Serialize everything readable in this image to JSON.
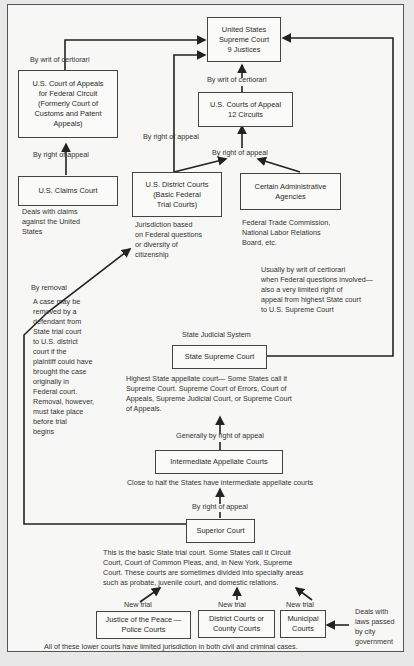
{
  "diagram": {
    "federal": {
      "supreme_court": "United States\nSupreme Court\n9 Justices",
      "federal_circuit": "U.S. Court of Appeals\nfor Federal Circuit\n(Formerly Court of\nCustoms and Patent\nAppeals)",
      "courts_of_appeal": "U.S. Courts of Appeal\n12 Circuits",
      "claims_court": "U.S. Claims Court",
      "claims_court_note": "Deals with claims\nagainst the United\nStates",
      "district_courts": "U.S. District Courts\n(Basic Federal\nTrial Courts)",
      "district_courts_note": "Jurisdiction based\non Federal questions\nor diversity of\ncitizenship",
      "admin_agencies": "Certain Administrative\nAgencies",
      "admin_agencies_note": "Federal Trade Commission,\nNational Labor Relations\nBoard, etc."
    },
    "labels": {
      "cert_federal_circuit": "By writ of certiorari",
      "cert_courts_of_appeal": "By writ of certiorari",
      "appeal_claims": "By right of appeal",
      "appeal_district": "By right of appeal",
      "appeal_to_circuits": "By right of appeal",
      "state_to_us_supreme": "Usually by writ of certiorari\nwhen Federal questions involved—\nalso a very limited right of\nappeal from highest State court\nto U.S. Supreme Court",
      "removal_title": "By removal",
      "removal_note": "A case may be\nremoved by a\ndefendant from\nState trial court\nto U.S. district\ncourt if the\nplaintiff could have\nbrought the case\noriginally in\nFederal court.\nRemoval, however,\nmust take place\nbefore trial\nbegins",
      "generally_appeal": "Generally by right of appeal",
      "by_right_appeal_state": "By right of appeal",
      "new_trial_1": "New trial",
      "new_trial_2": "New trial",
      "new_trial_3": "New trial"
    },
    "state": {
      "system_title": "State Judicial System",
      "supreme_court": "State Supreme Court",
      "supreme_court_note": "Highest State appellate court— Some States  call it\nSupreme Court. Supreme Court of Errors, Court of\nAppeals, Supreme Judicial Court, or Supreme Court\nof Appeals.",
      "intermediate": "Intermediate Appellate Courts",
      "intermediate_note": "Close to half the States have intermediate appellate courts",
      "superior": "Superior Court",
      "superior_note": "This is the basic State trial court.  Some States call it Circuit\nCourt, Court of Common Pleas, and, in New York, Supreme\nCourt.  These courts are sometimes divided into specialty areas\nsuch as probate, juvenile court, and domestic relations.",
      "justice_peace": "Justice of the Peace —\nPolice Courts",
      "district_county": "District Courts or\nCounty Courts",
      "municipal": "Municipal\nCourts",
      "municipal_note": "Deals with\nlaws passed\nby city\ngovernment",
      "footer": "All of these lower courts have limited jurisdiction in both civil and criminal cases."
    }
  }
}
